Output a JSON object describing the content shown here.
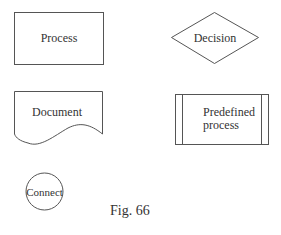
{
  "diagram": {
    "type": "flowchart-symbol-legend",
    "shapes": [
      {
        "id": "process",
        "shape": "rectangle",
        "label": "Process"
      },
      {
        "id": "decision",
        "shape": "diamond",
        "label": "Decision"
      },
      {
        "id": "document",
        "shape": "document",
        "label": "Document"
      },
      {
        "id": "predefined",
        "shape": "predefined-process",
        "label_line1": "Predefined",
        "label_line2": "process"
      },
      {
        "id": "connect",
        "shape": "circle",
        "label": "Connect"
      }
    ],
    "caption": "Fig. 66"
  },
  "colors": {
    "stroke": "#555555",
    "text": "#333333",
    "background": "#ffffff"
  }
}
